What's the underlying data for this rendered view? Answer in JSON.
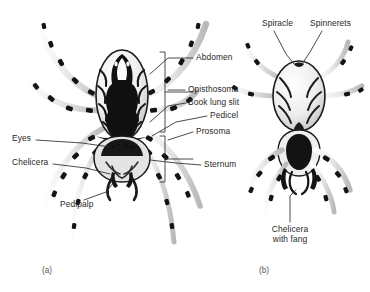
{
  "figure": {
    "background_color": "#ffffff",
    "text_color": "#272727",
    "caption_color": "#555555",
    "leader_color": "#2b2b2b",
    "width": 370,
    "height": 292
  },
  "panels": [
    {
      "id": "a",
      "caption": "(a)",
      "view": "dorsal",
      "x": 42,
      "y": 266
    },
    {
      "id": "b",
      "caption": "(b)",
      "view": "ventral",
      "x": 259,
      "y": 266
    }
  ],
  "labels": {
    "spiracle": {
      "text": "Spiracle",
      "x": 262,
      "y": 24,
      "align": "left"
    },
    "spinnerets": {
      "text": "Spinnerets",
      "x": 310,
      "y": 24,
      "align": "left"
    },
    "abdomen": {
      "text": "Abdomen",
      "x": 196,
      "y": 56,
      "align": "left"
    },
    "opisthosoma": {
      "text": "Opisthosoma",
      "x": 188,
      "y": 88,
      "align": "left"
    },
    "book_lung_slit": {
      "text": "Book lung slit",
      "x": 188,
      "y": 101,
      "align": "left"
    },
    "pedicel": {
      "text": "Pedicel",
      "x": 210,
      "y": 114,
      "align": "left"
    },
    "prosoma": {
      "text": "Prosoma",
      "x": 196,
      "y": 130,
      "align": "left"
    },
    "sternum": {
      "text": "Sternum",
      "x": 204,
      "y": 163,
      "align": "left"
    },
    "eyes": {
      "text": "Eyes",
      "x": 12,
      "y": 137,
      "align": "left"
    },
    "chelicera": {
      "text": "Chelicera",
      "x": 12,
      "y": 161,
      "align": "left"
    },
    "pedipalp": {
      "text": "Pedipalp",
      "x": 60,
      "y": 203,
      "align": "left"
    },
    "chelicera_with_fang_line1": {
      "text": "Chelicera",
      "x": 290,
      "y": 228,
      "align": "center"
    },
    "chelicera_with_fang_line2": {
      "text": "with fang",
      "x": 290,
      "y": 238,
      "align": "center"
    }
  }
}
